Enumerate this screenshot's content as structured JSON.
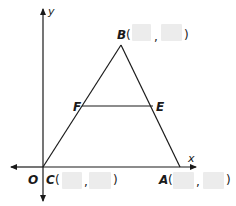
{
  "diagram": {
    "type": "coordinate-plane-triangle",
    "axes": {
      "x_label": "x",
      "y_label": "y",
      "origin_label": "O"
    },
    "points": {
      "B": {
        "label": "B",
        "x_blank": "",
        "y_blank": ""
      },
      "C": {
        "label": "C",
        "x_blank": "",
        "y_blank": ""
      },
      "A": {
        "label": "A",
        "x_blank": "",
        "y_blank": ""
      },
      "F": {
        "label": "F"
      },
      "E": {
        "label": "E"
      }
    },
    "segments": [
      "CB",
      "BA",
      "CA",
      "FE"
    ],
    "punctuation": {
      "open": "(",
      "comma": ",",
      "close": ")"
    },
    "colors": {
      "line": "#1a1a1a",
      "blank_fill": "#ececec",
      "background": "#ffffff"
    }
  }
}
